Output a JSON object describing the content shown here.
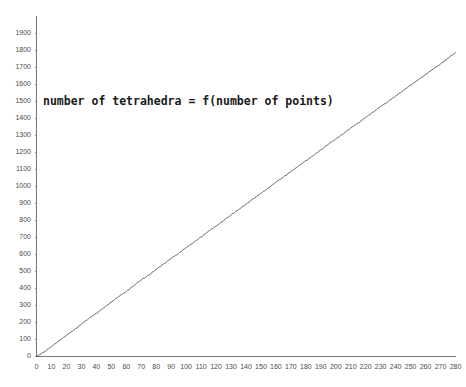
{
  "chart_data": {
    "type": "line",
    "title": "number of tetrahedra = f(number of points)",
    "xlabel": "",
    "ylabel": "",
    "xlim": [
      0,
      285
    ],
    "ylim": [
      0,
      1950
    ],
    "grid": false,
    "legend": null,
    "x_ticks": [
      0,
      10,
      20,
      30,
      40,
      50,
      60,
      70,
      80,
      90,
      100,
      110,
      120,
      130,
      140,
      150,
      160,
      170,
      180,
      190,
      200,
      210,
      220,
      230,
      240,
      250,
      260,
      270,
      280
    ],
    "y_ticks": [
      0,
      100,
      200,
      300,
      400,
      500,
      600,
      700,
      800,
      900,
      1000,
      1100,
      1200,
      1300,
      1400,
      1500,
      1600,
      1700,
      1800,
      1900
    ],
    "line_color": "#5a5a5a",
    "series": [
      {
        "name": "number of tetrahedra",
        "x": [
          0,
          5,
          10,
          15,
          20,
          25,
          30,
          35,
          40,
          45,
          50,
          55,
          60,
          65,
          70,
          75,
          80,
          85,
          90,
          95,
          100,
          105,
          110,
          115,
          120,
          125,
          130,
          135,
          140,
          145,
          150,
          155,
          160,
          165,
          170,
          175,
          180,
          185,
          190,
          195,
          200,
          205,
          210,
          215,
          220,
          225,
          230,
          235,
          240,
          245,
          250,
          255,
          260,
          265,
          270,
          275,
          280
        ],
        "values": [
          0,
          26,
          58,
          92,
          124,
          156,
          190,
          224,
          253,
          287,
          320,
          352,
          382,
          416,
          450,
          478,
          512,
          544,
          576,
          606,
          640,
          670,
          702,
          736,
          766,
          798,
          832,
          862,
          894,
          928,
          958,
          990,
          1024,
          1054,
          1086,
          1118,
          1150,
          1180,
          1214,
          1246,
          1278,
          1308,
          1342,
          1372,
          1404,
          1436,
          1468,
          1498,
          1530,
          1562,
          1594,
          1624,
          1656,
          1688,
          1718,
          1752,
          1786
        ]
      }
    ]
  },
  "axes": {
    "y_axis_name": "value-axis",
    "x_axis_name": "category-axis"
  }
}
